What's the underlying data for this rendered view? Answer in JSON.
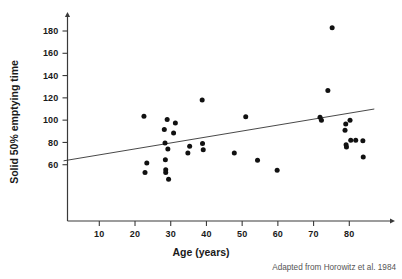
{
  "chart_data": {
    "type": "scatter",
    "title": "",
    "xlabel": "Age (years)",
    "ylabel": "Solid 50% emptying time",
    "xlim": [
      0,
      88
    ],
    "ylim": [
      38,
      192
    ],
    "xticks": [
      10,
      20,
      30,
      40,
      50,
      60,
      70,
      80
    ],
    "yticks": [
      60,
      80,
      100,
      120,
      140,
      160,
      180
    ],
    "xticklabels": [
      "10",
      "20",
      "30",
      "40",
      "50",
      "60",
      "70",
      "80"
    ],
    "yticklabels": [
      "60",
      "80",
      "100",
      "120",
      "140",
      "160",
      "180"
    ],
    "grid": false,
    "legend": null,
    "marker": "filled-circle",
    "marker_color": "#111111",
    "points": [
      {
        "x": 22.5,
        "y": 103.5
      },
      {
        "x": 22.8,
        "y": 53.0
      },
      {
        "x": 23.3,
        "y": 61.5
      },
      {
        "x": 28.2,
        "y": 91.5
      },
      {
        "x": 28.4,
        "y": 79.5
      },
      {
        "x": 28.5,
        "y": 64.5
      },
      {
        "x": 28.6,
        "y": 55.5
      },
      {
        "x": 28.6,
        "y": 53.0
      },
      {
        "x": 29.0,
        "y": 100.5
      },
      {
        "x": 29.2,
        "y": 74.0
      },
      {
        "x": 29.4,
        "y": 47.0
      },
      {
        "x": 30.8,
        "y": 88.5
      },
      {
        "x": 31.3,
        "y": 97.5
      },
      {
        "x": 34.8,
        "y": 70.5
      },
      {
        "x": 35.3,
        "y": 76.5
      },
      {
        "x": 38.8,
        "y": 118.0
      },
      {
        "x": 38.9,
        "y": 79.0
      },
      {
        "x": 39.1,
        "y": 73.5
      },
      {
        "x": 47.8,
        "y": 70.5
      },
      {
        "x": 51.0,
        "y": 103.0
      },
      {
        "x": 54.3,
        "y": 64.0
      },
      {
        "x": 59.8,
        "y": 55.0
      },
      {
        "x": 71.8,
        "y": 102.5
      },
      {
        "x": 72.2,
        "y": 100.0
      },
      {
        "x": 74.0,
        "y": 126.5
      },
      {
        "x": 75.2,
        "y": 183.0
      },
      {
        "x": 78.8,
        "y": 91.0
      },
      {
        "x": 79.0,
        "y": 96.5
      },
      {
        "x": 79.1,
        "y": 78.0
      },
      {
        "x": 79.2,
        "y": 76.0
      },
      {
        "x": 80.2,
        "y": 100.0
      },
      {
        "x": 80.4,
        "y": 82.0
      },
      {
        "x": 81.8,
        "y": 82.0
      },
      {
        "x": 83.8,
        "y": 81.5
      },
      {
        "x": 83.9,
        "y": 67.0
      }
    ],
    "trendline": {
      "type": "linear-fit",
      "x_start": 0.0,
      "y_start": 63.5,
      "x_end": 87.0,
      "y_end": 110.0
    },
    "annotation": "Adapted from Horowitz et al. 1984"
  },
  "credit": {
    "text": "Adapted from Horowitz et al. 1984"
  }
}
